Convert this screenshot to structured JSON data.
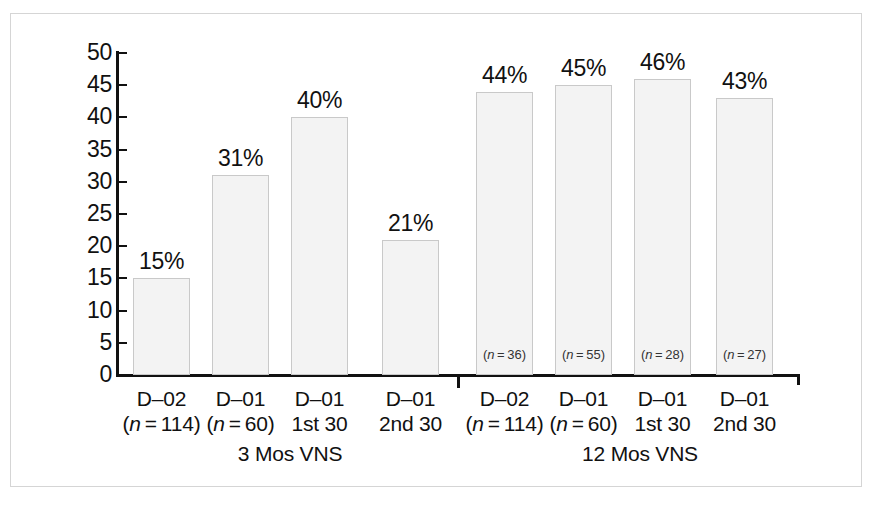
{
  "chart_data": {
    "type": "bar",
    "title": "",
    "subtitle": "",
    "xlabel": "",
    "ylabel": "",
    "ylim": [
      0,
      50
    ],
    "grid": false,
    "legend": "none",
    "y_ticks": [
      "50",
      "45",
      "40",
      "35",
      "30",
      "25",
      "20",
      "15",
      "10",
      "5",
      "0"
    ],
    "y_tick_values": [
      50,
      45,
      40,
      35,
      30,
      25,
      20,
      15,
      10,
      5,
      0
    ],
    "categories": [
      "D–02 (n = 114)",
      "D–01 (n = 60)",
      "D–01 1st 30",
      "D–01 2nd 30",
      "D–02 (n = 114)",
      "D–01 (n = 60)",
      "D–01 1st 30",
      "D–01 2nd 30"
    ],
    "values": [
      15,
      31,
      40,
      21,
      44,
      45,
      46,
      43
    ],
    "value_labels": [
      "15%",
      "31%",
      "40%",
      "21%",
      "44%",
      "45%",
      "46%",
      "43%"
    ],
    "bar_notes": [
      "",
      "",
      "",
      "",
      "(n = 36)",
      "(n = 55)",
      "(n = 28)",
      "(n = 27)"
    ],
    "bar_fill_color": "#f3f3f3",
    "bar_edge_color": "#c9c9c9",
    "axis_color": "#111111",
    "groups": [
      {
        "label": "3 Mos VNS",
        "bars": [
          0,
          1,
          2,
          3
        ]
      },
      {
        "label": "12 Mos VNS",
        "bars": [
          4,
          5,
          6,
          7
        ]
      }
    ]
  },
  "axis": {
    "y_ticks": [
      {
        "label": "50",
        "value": 50
      },
      {
        "label": "45",
        "value": 45
      },
      {
        "label": "40",
        "value": 40
      },
      {
        "label": "35",
        "value": 35
      },
      {
        "label": "30",
        "value": 30
      },
      {
        "label": "25",
        "value": 25
      },
      {
        "label": "20",
        "value": 20
      },
      {
        "label": "15",
        "value": 15
      },
      {
        "label": "10",
        "value": 10
      },
      {
        "label": "5",
        "value": 5
      },
      {
        "label": "0",
        "value": 0
      }
    ]
  },
  "bars": [
    {
      "value_label": "15%",
      "note": "",
      "cat_line1": "D–02",
      "cat_line2_pre": "(",
      "cat_line2_italic": "n",
      "cat_line2_post": " = 114)"
    },
    {
      "value_label": "31%",
      "note": "",
      "cat_line1": "D–01",
      "cat_line2_pre": "(",
      "cat_line2_italic": "n",
      "cat_line2_post": " = 60)"
    },
    {
      "value_label": "40%",
      "note": "",
      "cat_line1": "D–01",
      "cat_line2_pre": "1st 30",
      "cat_line2_italic": "",
      "cat_line2_post": ""
    },
    {
      "value_label": "21%",
      "note": "",
      "cat_line1": "D–01",
      "cat_line2_pre": "2nd 30",
      "cat_line2_italic": "",
      "cat_line2_post": ""
    },
    {
      "value_label": "44%",
      "note_pre": "(",
      "note_italic": "n",
      "note_post": " = 36)",
      "cat_line1": "D–02",
      "cat_line2_pre": "(",
      "cat_line2_italic": "n",
      "cat_line2_post": " = 114)"
    },
    {
      "value_label": "45%",
      "note_pre": "(",
      "note_italic": "n",
      "note_post": " = 55)",
      "cat_line1": "D–01",
      "cat_line2_pre": "(",
      "cat_line2_italic": "n",
      "cat_line2_post": " = 60)"
    },
    {
      "value_label": "46%",
      "note_pre": "(",
      "note_italic": "n",
      "note_post": " = 28)",
      "cat_line1": "D–01",
      "cat_line2_pre": "1st 30",
      "cat_line2_italic": "",
      "cat_line2_post": ""
    },
    {
      "value_label": "43%",
      "note_pre": "(",
      "note_italic": "n",
      "note_post": " = 27)",
      "cat_line1": "D–01",
      "cat_line2_pre": "2nd 30",
      "cat_line2_italic": "",
      "cat_line2_post": ""
    }
  ],
  "groups": [
    {
      "label": "3 Mos VNS"
    },
    {
      "label": "12 Mos VNS"
    }
  ]
}
